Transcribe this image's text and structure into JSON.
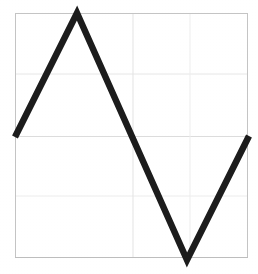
{
  "figure": {
    "background_color": "#ffffff",
    "width": 258,
    "height": 274
  },
  "chart_data": {
    "type": "line",
    "title": "",
    "subtitle": "",
    "xlabel": "",
    "ylabel": "",
    "x": [
      0,
      0.265,
      0.735,
      1
    ],
    "y": [
      0,
      1,
      -1,
      0
    ],
    "series": [
      {
        "name": "zigzag",
        "x": [
          0,
          0.265,
          0.735,
          1
        ],
        "y": [
          0,
          1,
          -1,
          0
        ],
        "color": "#1c1c1c",
        "line_width": 6.5,
        "marker": "none",
        "style": "solid"
      }
    ],
    "xlim": [
      0,
      1
    ],
    "ylim": [
      -1,
      1
    ],
    "xticks": [],
    "yticks": [],
    "xticklabels": [],
    "yticklabels": [],
    "grid": true,
    "grid_color": "#e2e2e2",
    "grid_x_positions": [
      0.505,
      0.751
    ],
    "grid_y_positions": [
      0.5,
      0.0,
      -0.489
    ],
    "legend": false,
    "legend_position": "none",
    "annotations": [],
    "frame": {
      "visible": true,
      "color": "#c9c9c9",
      "line_width": 1
    }
  },
  "geometry": {
    "frame_left": 15,
    "frame_top": 13,
    "frame_right": 248,
    "frame_bottom": 258,
    "midline_y": 136.5,
    "gridline_y_upper": 74,
    "gridline_y_lower": 196,
    "gridline_x_mid": 133,
    "gridline_x_right": 190,
    "peak_x": 77,
    "peak_y": 13,
    "valley_x": 187,
    "valley_y": 260,
    "start_x": 15,
    "start_y": 137,
    "end_x": 249,
    "end_y": 136
  }
}
